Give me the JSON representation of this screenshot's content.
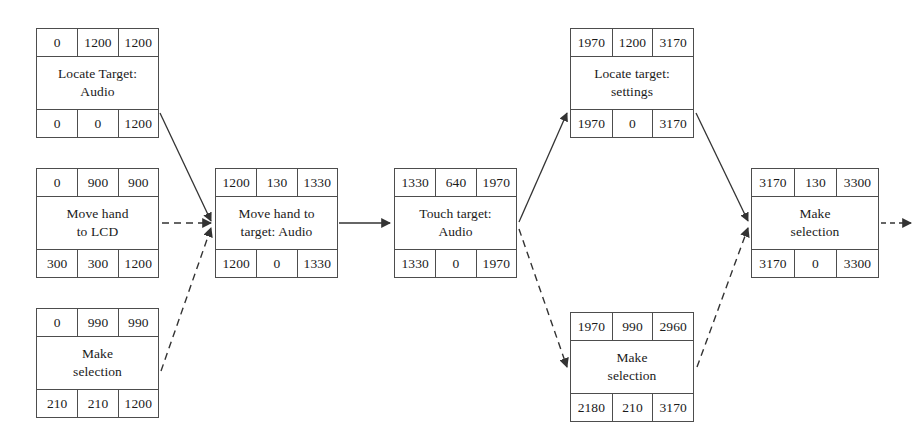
{
  "diagram": {
    "type": "activity-on-node-network",
    "title": "",
    "row_headers": [
      "earliest-start",
      "duration",
      "earliest-finish",
      "latest-start",
      "slack",
      "latest-finish"
    ],
    "colors": {
      "line": "#4d4d4d",
      "text": "#1a1a1a",
      "background": "#ffffff"
    },
    "nodes": [
      {
        "id": "locate-target-audio",
        "label": "Locate Target:\nAudio",
        "top": [
          "0",
          "1200",
          "1200"
        ],
        "bottom": [
          "0",
          "0",
          "1200"
        ],
        "x": 36,
        "y": 28,
        "w": 123,
        "h": 110
      },
      {
        "id": "move-hand-to-lcd",
        "label": "Move hand\nto LCD",
        "top": [
          "0",
          "900",
          "900"
        ],
        "bottom": [
          "300",
          "300",
          "1200"
        ],
        "x": 36,
        "y": 168,
        "w": 123,
        "h": 110
      },
      {
        "id": "make-selection-left",
        "label": "Make\nselection",
        "top": [
          "0",
          "990",
          "990"
        ],
        "bottom": [
          "210",
          "210",
          "1200"
        ],
        "x": 36,
        "y": 308,
        "w": 123,
        "h": 110
      },
      {
        "id": "move-hand-to-target-audio",
        "label": "Move hand to\ntarget: Audio",
        "top": [
          "1200",
          "130",
          "1330"
        ],
        "bottom": [
          "1200",
          "0",
          "1330"
        ],
        "x": 215,
        "y": 168,
        "w": 123,
        "h": 110
      },
      {
        "id": "touch-target-audio",
        "label": "Touch target:\nAudio",
        "top": [
          "1330",
          "640",
          "1970"
        ],
        "bottom": [
          "1330",
          "0",
          "1970"
        ],
        "x": 394,
        "y": 168,
        "w": 123,
        "h": 110
      },
      {
        "id": "locate-target-settings",
        "label": "Locate target:\nsettings",
        "top": [
          "1970",
          "1200",
          "3170"
        ],
        "bottom": [
          "1970",
          "0",
          "3170"
        ],
        "x": 570,
        "y": 28,
        "w": 124,
        "h": 110
      },
      {
        "id": "make-selection-bottom",
        "label": "Make\nselection",
        "top": [
          "1970",
          "990",
          "2960"
        ],
        "bottom": [
          "2180",
          "210",
          "3170"
        ],
        "x": 570,
        "y": 312,
        "w": 124,
        "h": 110
      },
      {
        "id": "make-selection-right",
        "label": "Make\nselection",
        "top": [
          "3170",
          "130",
          "3300"
        ],
        "bottom": [
          "3170",
          "0",
          "3300"
        ],
        "x": 751,
        "y": 168,
        "w": 128,
        "h": 110
      }
    ],
    "edges": [
      {
        "id": "edge-locate-audio-to-move-target",
        "from": "locate-target-audio",
        "to": "move-hand-to-target-audio",
        "style": "solid"
      },
      {
        "id": "edge-move-lcd-to-move-target",
        "from": "move-hand-to-lcd",
        "to": "move-hand-to-target-audio",
        "style": "dashed"
      },
      {
        "id": "edge-make-selection-left-to-move-target",
        "from": "make-selection-left",
        "to": "move-hand-to-target-audio",
        "style": "dashed"
      },
      {
        "id": "edge-move-target-to-touch-target",
        "from": "move-hand-to-target-audio",
        "to": "touch-target-audio",
        "style": "solid"
      },
      {
        "id": "edge-touch-target-to-locate-settings",
        "from": "touch-target-audio",
        "to": "locate-target-settings",
        "style": "solid"
      },
      {
        "id": "edge-touch-target-to-make-selection-bottom",
        "from": "touch-target-audio",
        "to": "make-selection-bottom",
        "style": "dashed"
      },
      {
        "id": "edge-locate-settings-to-make-selection-right",
        "from": "locate-target-settings",
        "to": "make-selection-right",
        "style": "solid"
      },
      {
        "id": "edge-make-selection-bottom-to-make-selection-right",
        "from": "make-selection-bottom",
        "to": "make-selection-right",
        "style": "dashed"
      },
      {
        "id": "edge-make-selection-right-exit",
        "from": "make-selection-right",
        "to": "exit",
        "style": "dashed"
      }
    ]
  }
}
